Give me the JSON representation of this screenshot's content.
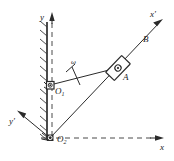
{
  "figure": {
    "type": "kinematics-mechanism-diagram",
    "background_color": "#ffffff",
    "line_color": "#2b2b2b",
    "width": 174,
    "height": 161
  },
  "labels": {
    "y_axis": "y",
    "x_axis": "x",
    "x_prime_axis": "x'",
    "y_prime_axis": "y'",
    "point_O1": "O",
    "point_O1_sub": "1",
    "point_O2": "O",
    "point_O2_sub": "2",
    "point_A": "A",
    "point_B": "B",
    "omega": "ω"
  },
  "geometry": {
    "origin_O2": [
      50,
      138
    ],
    "pivot_O1": [
      50,
      85
    ],
    "slider_A": [
      118,
      68
    ],
    "point_B": [
      148,
      38
    ],
    "x_axis_arrow_tip": [
      162,
      138
    ],
    "y_axis_arrow_tip": [
      52,
      13
    ],
    "x_prime_arrow_tip": [
      162,
      20
    ],
    "y_prime_arrow_tip": [
      18,
      111
    ],
    "wall_top": [
      47,
      22
    ],
    "wall_bottom": [
      47,
      140
    ]
  },
  "elements": {
    "wall": "fixed-hatched-wall",
    "crank": "rod-O1-A",
    "slotted_link": "slotted-bar-O2-B",
    "slider": "slider-block-at-A",
    "support_O1": "pin-support-O1",
    "support_O2": "pin-support-O2",
    "angular_velocity_marker": "omega-tick-on-crank"
  }
}
